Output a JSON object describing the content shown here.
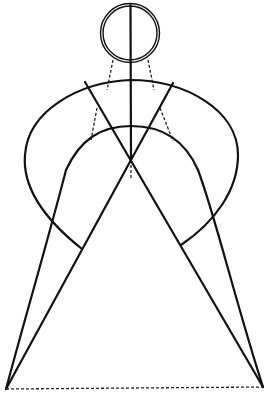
{
  "figure": {
    "title": "Proportional construction of a figure",
    "stroke_color": "#111111",
    "background": "#ffffff",
    "head": {
      "cx": 130,
      "cy": 33,
      "r_outer": 30,
      "r_inner": 27
    },
    "center_axis": {
      "x": 131,
      "y_top": 5,
      "y_bottom": 160,
      "dashed_to": 178
    },
    "shoulder_arc": {
      "start": [
        27,
        165
      ],
      "control_top": [
        130,
        60
      ],
      "end": [
        238,
        165
      ]
    },
    "outer_cape": {
      "left": {
        "from": [
          82,
          249
        ],
        "c1": [
          30,
          210
        ],
        "c2": [
          10,
          120
        ],
        "to": [
          130,
          80
        ]
      },
      "right": {
        "from": [
          130,
          80
        ],
        "c1": [
          250,
          110
        ],
        "c2": [
          240,
          210
        ],
        "to": [
          181,
          245
        ]
      }
    },
    "inner_arch": {
      "left_base": [
        6,
        389
      ],
      "right_base": [
        263,
        387
      ],
      "top": [
        131,
        126
      ]
    },
    "diagonals": [
      {
        "from": [
          85,
          82
        ],
        "to": [
          263,
          387
        ]
      },
      {
        "from": [
          172,
          83
        ],
        "to": [
          6,
          389
        ]
      }
    ],
    "crossing_point": [
      131,
      159
    ],
    "neck_guides": [
      {
        "from": [
          112,
          60
        ],
        "to": [
          110,
          130
        ]
      },
      {
        "from": [
          150,
          60
        ],
        "to": [
          172,
          135
        ]
      }
    ],
    "base_line": {
      "from": [
        6,
        389
      ],
      "to": [
        263,
        387
      ],
      "style": "dashed"
    }
  }
}
